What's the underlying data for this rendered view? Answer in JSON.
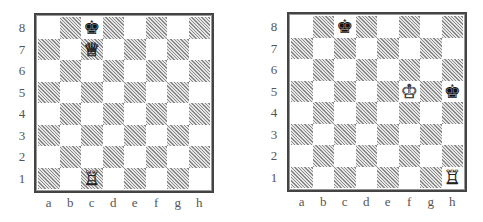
{
  "files": [
    "a",
    "b",
    "c",
    "d",
    "e",
    "f",
    "g",
    "h"
  ],
  "ranks": [
    "8",
    "7",
    "6",
    "5",
    "4",
    "3",
    "2",
    "1"
  ],
  "glyphs": {
    "white-king": "♔",
    "white-queen": "♕",
    "white-rook": "♖",
    "black-king": "♚"
  },
  "diagrams": [
    {
      "id": "left",
      "pieces": [
        {
          "square": "c8",
          "piece": "black-king"
        },
        {
          "square": "c7",
          "piece": "white-queen"
        },
        {
          "square": "c1",
          "piece": "white-rook"
        }
      ]
    },
    {
      "id": "right",
      "pieces": [
        {
          "square": "c8",
          "piece": "black-king"
        },
        {
          "square": "f5",
          "piece": "white-king"
        },
        {
          "square": "h5",
          "piece": "black-king"
        },
        {
          "square": "h1",
          "piece": "white-rook"
        }
      ]
    }
  ]
}
